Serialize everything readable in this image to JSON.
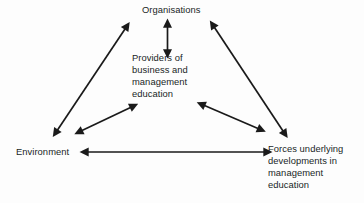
{
  "diagram": {
    "background_color": "#fdfdfd",
    "line_color": "#1a1a1a",
    "text_color": "#201f1f",
    "nodes": [
      {
        "id": "organisations",
        "label": "Organisations",
        "position": "top-center"
      },
      {
        "id": "providers",
        "label": "Providers of\nbusiness and\nmanagement\neducation",
        "position": "center"
      },
      {
        "id": "environment",
        "label": "Environment",
        "position": "bottom-left"
      },
      {
        "id": "forces",
        "label": "Forces underlying\ndevelopments in\nmanagement\neducation",
        "position": "bottom-right"
      }
    ],
    "connections": [
      {
        "id": "organisations-providers",
        "from": "Organisations",
        "to": "Providers of business and management education",
        "style": "double-headed-arrow",
        "orientation": "vertical"
      },
      {
        "id": "organisations-environment",
        "from": "Organisations",
        "to": "Environment",
        "style": "double-headed-arrow",
        "orientation": "diagonal-left"
      },
      {
        "id": "organisations-forces",
        "from": "Organisations",
        "to": "Forces underlying developments in management education",
        "style": "double-headed-arrow",
        "orientation": "diagonal-right"
      },
      {
        "id": "environment-providers",
        "from": "Environment",
        "to": "Providers of business and management education",
        "style": "double-headed-arrow",
        "orientation": "diagonal-inner-left"
      },
      {
        "id": "providers-forces",
        "from": "Providers of business and management education",
        "to": "Forces underlying developments in management education",
        "style": "double-headed-arrow",
        "orientation": "diagonal-inner-right"
      },
      {
        "id": "environment-forces",
        "from": "Environment",
        "to": "Forces underlying developments in management education",
        "style": "double-headed-arrow",
        "orientation": "horizontal"
      }
    ]
  }
}
